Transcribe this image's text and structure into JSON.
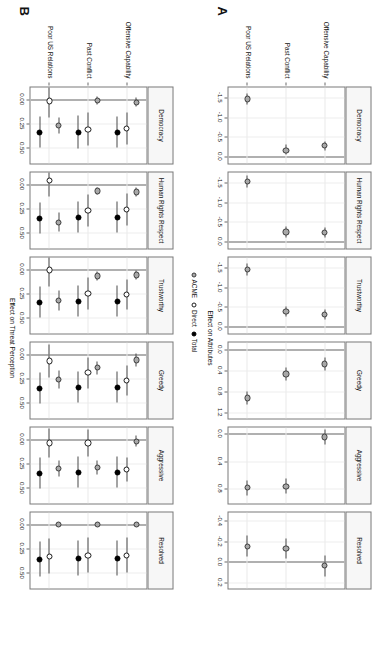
{
  "figure": {
    "panelA_letter": "A",
    "panelB_letter": "B",
    "legend": [
      {
        "key": "acme",
        "label": "ACME"
      },
      {
        "key": "direct",
        "label": "Direct"
      },
      {
        "key": "total",
        "label": "Total"
      }
    ]
  },
  "chart_data": [
    {
      "type": "scatter",
      "panel": "A",
      "title": "",
      "xlabel": "Effect on Attributes",
      "ylabel": "",
      "treatments": [
        "Offensive Capability",
        "Past Conflict",
        "Poor US Relations"
      ],
      "series": [
        {
          "name": "ACME",
          "symbol": "grey-filled-circle"
        }
      ],
      "grid": true,
      "legend_position": "between-panels",
      "facets": [
        {
          "name": "Democracy",
          "xlim": [
            -1.75,
            0.18
          ],
          "xticks": [
            -1.5,
            -1.0,
            -0.5,
            0.0
          ],
          "xticklabels": [
            "-1.5",
            "-1.0",
            "-0.5",
            "0.0"
          ],
          "zero": 0.0,
          "points": [
            {
              "treatment": "Offensive Capability",
              "series": "ACME",
              "estimate": -0.27,
              "lo": -0.39,
              "hi": -0.15
            },
            {
              "treatment": "Past Conflict",
              "series": "ACME",
              "estimate": -0.16,
              "lo": -0.29,
              "hi": -0.04
            },
            {
              "treatment": "Poor US Relations",
              "series": "ACME",
              "estimate": -1.46,
              "lo": -1.6,
              "hi": -1.32
            }
          ]
        },
        {
          "name": "Human Rights Respect",
          "xlim": [
            -1.75,
            0.18
          ],
          "xticks": [
            -1.5,
            -1.0,
            -0.5,
            0.0
          ],
          "xticklabels": [
            "-1.5",
            "-1.0",
            "-0.5",
            "0.0"
          ],
          "zero": 0.0,
          "points": [
            {
              "treatment": "Offensive Capability",
              "series": "ACME",
              "estimate": -0.22,
              "lo": -0.35,
              "hi": -0.09
            },
            {
              "treatment": "Past Conflict",
              "series": "ACME",
              "estimate": -0.24,
              "lo": -0.37,
              "hi": -0.11
            },
            {
              "treatment": "Poor US Relations",
              "series": "ACME",
              "estimate": -1.53,
              "lo": -1.68,
              "hi": -1.38
            }
          ]
        },
        {
          "name": "Trustworthy",
          "xlim": [
            -1.75,
            0.18
          ],
          "xticks": [
            -1.5,
            -1.0,
            -0.5,
            0.0
          ],
          "xticklabels": [
            "-1.5",
            "-1.0",
            "-0.5",
            "0.0"
          ],
          "zero": 0.0,
          "points": [
            {
              "treatment": "Offensive Capability",
              "series": "ACME",
              "estimate": -0.3,
              "lo": -0.43,
              "hi": -0.17
            },
            {
              "treatment": "Past Conflict",
              "series": "ACME",
              "estimate": -0.38,
              "lo": -0.51,
              "hi": -0.25
            },
            {
              "treatment": "Poor US Relations",
              "series": "ACME",
              "estimate": -1.44,
              "lo": -1.59,
              "hi": -1.29
            }
          ]
        },
        {
          "name": "Greedy",
          "xlim": [
            -0.13,
            1.32
          ],
          "xticks": [
            0.0,
            0.4,
            0.8,
            1.2
          ],
          "xticklabels": [
            "0.0",
            "0.4",
            "0.8",
            "1.2"
          ],
          "zero": 0.0,
          "points": [
            {
              "treatment": "Offensive Capability",
              "series": "ACME",
              "estimate": 0.28,
              "lo": 0.16,
              "hi": 0.4
            },
            {
              "treatment": "Past Conflict",
              "series": "ACME",
              "estimate": 0.47,
              "lo": 0.35,
              "hi": 0.59
            },
            {
              "treatment": "Poor US Relations",
              "series": "ACME",
              "estimate": 0.93,
              "lo": 0.8,
              "hi": 1.06
            }
          ]
        },
        {
          "name": "Aggressive",
          "xlim": [
            -0.09,
            1.02
          ],
          "xticks": [
            0.0,
            0.4,
            0.8
          ],
          "xticklabels": [
            "0.0",
            "0.4",
            "0.8"
          ],
          "zero": 0.0,
          "points": [
            {
              "treatment": "Offensive Capability",
              "series": "ACME",
              "estimate": 0.05,
              "lo": -0.06,
              "hi": 0.16
            },
            {
              "treatment": "Past Conflict",
              "series": "ACME",
              "estimate": 0.77,
              "lo": 0.66,
              "hi": 0.88
            },
            {
              "treatment": "Poor US Relations",
              "series": "ACME",
              "estimate": 0.79,
              "lo": 0.68,
              "hi": 0.9
            }
          ]
        },
        {
          "name": "Resolved",
          "xlim": [
            -0.48,
            0.26
          ],
          "xticks": [
            -0.4,
            -0.2,
            0.0,
            0.2
          ],
          "xticklabels": [
            "-0.4",
            "-0.2",
            "0.0",
            "0.2"
          ],
          "zero": 0.0,
          "points": [
            {
              "treatment": "Offensive Capability",
              "series": "ACME",
              "estimate": 0.04,
              "lo": -0.06,
              "hi": 0.14
            },
            {
              "treatment": "Past Conflict",
              "series": "ACME",
              "estimate": -0.13,
              "lo": -0.23,
              "hi": -0.03
            },
            {
              "treatment": "Poor US Relations",
              "series": "ACME",
              "estimate": -0.15,
              "lo": -0.26,
              "hi": -0.05
            }
          ]
        }
      ]
    },
    {
      "type": "scatter",
      "panel": "B",
      "title": "",
      "xlabel": "Effect on Threat Perception",
      "ylabel": "",
      "treatments": [
        "Offensive Capability",
        "Past Conflict",
        "Poor US Relations"
      ],
      "series": [
        {
          "name": "ACME",
          "symbol": "grey-filled-circle"
        },
        {
          "name": "Direct",
          "symbol": "open-circle"
        },
        {
          "name": "Total",
          "symbol": "black-filled-circle"
        }
      ],
      "grid": true,
      "legend_position": "between-panels",
      "facets": [
        {
          "name": "Democracy",
          "xlim": [
            -0.12,
            0.66
          ],
          "xticks": [
            0.0,
            0.25,
            0.5
          ],
          "xticklabels": [
            "0.00",
            "0.25",
            "0.50"
          ],
          "zero": 0.0,
          "points": [
            {
              "treatment": "Offensive Capability",
              "series": "ACME",
              "estimate": 0.03,
              "lo": -0.02,
              "hi": 0.08
            },
            {
              "treatment": "Offensive Capability",
              "series": "Direct",
              "estimate": 0.3,
              "lo": 0.14,
              "hi": 0.46
            },
            {
              "treatment": "Offensive Capability",
              "series": "Total",
              "estimate": 0.34,
              "lo": 0.18,
              "hi": 0.5
            },
            {
              "treatment": "Past Conflict",
              "series": "ACME",
              "estimate": 0.01,
              "lo": -0.03,
              "hi": 0.05
            },
            {
              "treatment": "Past Conflict",
              "series": "Direct",
              "estimate": 0.31,
              "lo": 0.14,
              "hi": 0.48
            },
            {
              "treatment": "Past Conflict",
              "series": "Total",
              "estimate": 0.34,
              "lo": 0.17,
              "hi": 0.51
            },
            {
              "treatment": "Poor US Relations",
              "series": "ACME",
              "estimate": 0.27,
              "lo": 0.19,
              "hi": 0.35
            },
            {
              "treatment": "Poor US Relations",
              "series": "Direct",
              "estimate": 0.02,
              "lo": -0.15,
              "hi": 0.19
            },
            {
              "treatment": "Poor US Relations",
              "series": "Total",
              "estimate": 0.34,
              "lo": 0.18,
              "hi": 0.5
            }
          ]
        },
        {
          "name": "Human Rights Respect",
          "xlim": [
            -0.12,
            0.66
          ],
          "xticks": [
            0.0,
            0.25,
            0.5
          ],
          "xticklabels": [
            "0.00",
            "0.25",
            "0.50"
          ],
          "zero": 0.0,
          "points": [
            {
              "treatment": "Offensive Capability",
              "series": "ACME",
              "estimate": 0.08,
              "lo": 0.03,
              "hi": 0.13
            },
            {
              "treatment": "Offensive Capability",
              "series": "Direct",
              "estimate": 0.26,
              "lo": 0.1,
              "hi": 0.42
            },
            {
              "treatment": "Offensive Capability",
              "series": "Total",
              "estimate": 0.34,
              "lo": 0.18,
              "hi": 0.5
            },
            {
              "treatment": "Past Conflict",
              "series": "ACME",
              "estimate": 0.07,
              "lo": 0.03,
              "hi": 0.11
            },
            {
              "treatment": "Past Conflict",
              "series": "Direct",
              "estimate": 0.27,
              "lo": 0.11,
              "hi": 0.43
            },
            {
              "treatment": "Past Conflict",
              "series": "Total",
              "estimate": 0.34,
              "lo": 0.18,
              "hi": 0.5
            },
            {
              "treatment": "Poor US Relations",
              "series": "ACME",
              "estimate": 0.39,
              "lo": 0.29,
              "hi": 0.49
            },
            {
              "treatment": "Poor US Relations",
              "series": "Direct",
              "estimate": -0.04,
              "lo": -0.21,
              "hi": 0.13
            },
            {
              "treatment": "Poor US Relations",
              "series": "Total",
              "estimate": 0.35,
              "lo": 0.19,
              "hi": 0.51
            }
          ]
        },
        {
          "name": "Trustworthy",
          "xlim": [
            -0.12,
            0.66
          ],
          "xticks": [
            0.0,
            0.25,
            0.5
          ],
          "xticklabels": [
            "0.00",
            "0.25",
            "0.50"
          ],
          "zero": 0.0,
          "points": [
            {
              "treatment": "Offensive Capability",
              "series": "ACME",
              "estimate": 0.06,
              "lo": 0.01,
              "hi": 0.11
            },
            {
              "treatment": "Offensive Capability",
              "series": "Direct",
              "estimate": 0.26,
              "lo": 0.11,
              "hi": 0.41
            },
            {
              "treatment": "Offensive Capability",
              "series": "Total",
              "estimate": 0.33,
              "lo": 0.17,
              "hi": 0.49
            },
            {
              "treatment": "Past Conflict",
              "series": "ACME",
              "estimate": 0.07,
              "lo": 0.02,
              "hi": 0.12
            },
            {
              "treatment": "Past Conflict",
              "series": "Direct",
              "estimate": 0.25,
              "lo": 0.09,
              "hi": 0.41
            },
            {
              "treatment": "Past Conflict",
              "series": "Total",
              "estimate": 0.33,
              "lo": 0.17,
              "hi": 0.49
            },
            {
              "treatment": "Poor US Relations",
              "series": "ACME",
              "estimate": 0.32,
              "lo": 0.22,
              "hi": 0.42
            },
            {
              "treatment": "Poor US Relations",
              "series": "Direct",
              "estimate": 0.01,
              "lo": -0.16,
              "hi": 0.18
            },
            {
              "treatment": "Poor US Relations",
              "series": "Total",
              "estimate": 0.34,
              "lo": 0.18,
              "hi": 0.5
            }
          ]
        },
        {
          "name": "Greedy",
          "xlim": [
            -0.12,
            0.66
          ],
          "xticks": [
            0.0,
            0.25,
            0.5
          ],
          "xticklabels": [
            "0.00",
            "0.25",
            "0.50"
          ],
          "zero": 0.0,
          "points": [
            {
              "treatment": "Offensive Capability",
              "series": "ACME",
              "estimate": 0.06,
              "lo": -0.01,
              "hi": 0.13
            },
            {
              "treatment": "Offensive Capability",
              "series": "Direct",
              "estimate": 0.27,
              "lo": 0.12,
              "hi": 0.42
            },
            {
              "treatment": "Offensive Capability",
              "series": "Total",
              "estimate": 0.34,
              "lo": 0.18,
              "hi": 0.5
            },
            {
              "treatment": "Past Conflict",
              "series": "ACME",
              "estimate": 0.14,
              "lo": 0.07,
              "hi": 0.21
            },
            {
              "treatment": "Past Conflict",
              "series": "Direct",
              "estimate": 0.19,
              "lo": 0.03,
              "hi": 0.35
            },
            {
              "treatment": "Past Conflict",
              "series": "Total",
              "estimate": 0.34,
              "lo": 0.18,
              "hi": 0.5
            },
            {
              "treatment": "Poor US Relations",
              "series": "ACME",
              "estimate": 0.26,
              "lo": 0.17,
              "hi": 0.35
            },
            {
              "treatment": "Poor US Relations",
              "series": "Direct",
              "estimate": 0.07,
              "lo": -0.1,
              "hi": 0.24
            },
            {
              "treatment": "Poor US Relations",
              "series": "Total",
              "estimate": 0.35,
              "lo": 0.19,
              "hi": 0.51
            }
          ]
        },
        {
          "name": "Aggressive",
          "xlim": [
            -0.12,
            0.66
          ],
          "xticks": [
            0.0,
            0.25,
            0.5
          ],
          "xticklabels": [
            "0.00",
            "0.25",
            "0.50"
          ],
          "zero": 0.0,
          "points": [
            {
              "treatment": "Offensive Capability",
              "series": "ACME",
              "estimate": 0.02,
              "lo": -0.04,
              "hi": 0.08
            },
            {
              "treatment": "Offensive Capability",
              "series": "Direct",
              "estimate": 0.31,
              "lo": 0.19,
              "hi": 0.43
            },
            {
              "treatment": "Offensive Capability",
              "series": "Total",
              "estimate": 0.34,
              "lo": 0.18,
              "hi": 0.5
            },
            {
              "treatment": "Past Conflict",
              "series": "ACME",
              "estimate": 0.29,
              "lo": 0.22,
              "hi": 0.36
            },
            {
              "treatment": "Past Conflict",
              "series": "Direct",
              "estimate": 0.04,
              "lo": -0.1,
              "hi": 0.18
            },
            {
              "treatment": "Past Conflict",
              "series": "Total",
              "estimate": 0.34,
              "lo": 0.18,
              "hi": 0.5
            },
            {
              "treatment": "Poor US Relations",
              "series": "ACME",
              "estimate": 0.3,
              "lo": 0.22,
              "hi": 0.38
            },
            {
              "treatment": "Poor US Relations",
              "series": "Direct",
              "estimate": 0.04,
              "lo": -0.11,
              "hi": 0.19
            },
            {
              "treatment": "Poor US Relations",
              "series": "Total",
              "estimate": 0.35,
              "lo": 0.19,
              "hi": 0.51
            }
          ]
        },
        {
          "name": "Resolved",
          "xlim": [
            -0.12,
            0.66
          ],
          "xticks": [
            0.0,
            0.25,
            0.5
          ],
          "xticklabels": [
            "0.00",
            "0.25",
            "0.50"
          ],
          "zero": 0.0,
          "points": [
            {
              "treatment": "Offensive Capability",
              "series": "ACME",
              "estimate": 0.0,
              "lo": -0.01,
              "hi": 0.01
            },
            {
              "treatment": "Offensive Capability",
              "series": "Direct",
              "estimate": 0.32,
              "lo": 0.14,
              "hi": 0.5
            },
            {
              "treatment": "Offensive Capability",
              "series": "Total",
              "estimate": 0.35,
              "lo": 0.17,
              "hi": 0.53
            },
            {
              "treatment": "Past Conflict",
              "series": "ACME",
              "estimate": 0.0,
              "lo": -0.01,
              "hi": 0.01
            },
            {
              "treatment": "Past Conflict",
              "series": "Direct",
              "estimate": 0.32,
              "lo": 0.14,
              "hi": 0.5
            },
            {
              "treatment": "Past Conflict",
              "series": "Total",
              "estimate": 0.35,
              "lo": 0.17,
              "hi": 0.53
            },
            {
              "treatment": "Poor US Relations",
              "series": "ACME",
              "estimate": 0.0,
              "lo": -0.01,
              "hi": 0.01
            },
            {
              "treatment": "Poor US Relations",
              "series": "Direct",
              "estimate": 0.33,
              "lo": 0.15,
              "hi": 0.51
            },
            {
              "treatment": "Poor US Relations",
              "series": "Total",
              "estimate": 0.36,
              "lo": 0.18,
              "hi": 0.54
            }
          ]
        }
      ]
    }
  ]
}
